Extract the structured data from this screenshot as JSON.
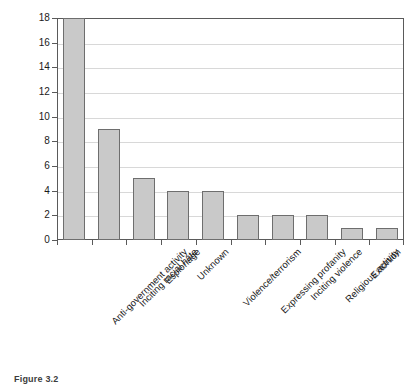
{
  "chart_data": {
    "type": "bar",
    "title": "",
    "subtitle": "",
    "xlabel": "",
    "ylabel": "",
    "ylim": [
      0,
      18
    ],
    "ytick_step": 2,
    "yticks": [
      0,
      2,
      4,
      6,
      8,
      10,
      12,
      14,
      16,
      18
    ],
    "ytick_labels": [
      "0",
      "2",
      "4",
      "6",
      "8",
      "10",
      "12",
      "14",
      "16",
      "18"
    ],
    "grid": "horizontal",
    "legend": "none",
    "categories": [
      "Anti-government activity",
      "Inciting racial hate",
      "Espionage",
      "Unknown",
      "Violence/terrorism",
      "Expressing profanity",
      "Inciting violence",
      "Religious activity",
      "Extortion",
      "Publishing false information"
    ],
    "values": [
      18,
      9,
      5,
      4,
      4,
      2,
      2,
      2,
      1,
      1
    ],
    "series": [
      {
        "name": "Count",
        "values": [
          18,
          9,
          5,
          4,
          4,
          2,
          2,
          2,
          1,
          1
        ]
      }
    ],
    "colors": {
      "bar_fill": "#c9c9c9",
      "bar_border": "#6e6e6e",
      "gridline": "#d8d8d8",
      "axis": "#5a5a5a",
      "text": "#1a1a1a",
      "background": "#ffffff"
    }
  },
  "caption": {
    "text": "Figure 3.2"
  }
}
